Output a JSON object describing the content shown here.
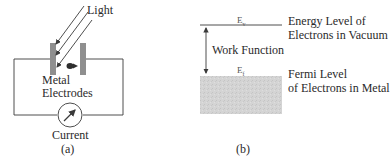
{
  "panel_a": {
    "light_label": "Light",
    "electrodes_label_line1": "Metal",
    "electrodes_label_line2": "Electrodes",
    "meter_label": "Current",
    "caption": "(a)"
  },
  "panel_b": {
    "vacuum_symbol": "Ev",
    "vacuum_label_line1": "Energy Level of",
    "vacuum_label_line2": "Electrons in Vacuum",
    "work_function_label": "Work Function",
    "fermi_symbol": "Ef",
    "fermi_label_line1": "Fermi Level",
    "fermi_label_line2": "of Electrons in Metal",
    "caption": "(b)"
  },
  "colors": {
    "line": "#3a3a3a",
    "electrode": "#8f8f8f",
    "metal_band": "#d2d2d2",
    "text": "#2a2a2a"
  }
}
